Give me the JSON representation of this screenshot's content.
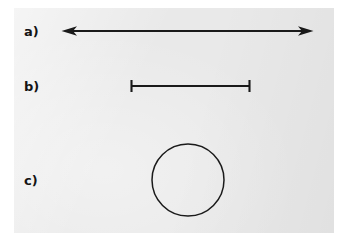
{
  "figure": {
    "panel": {
      "background_color": "#e9e9e9",
      "page_color": "#ffffff",
      "ink_color": "#1a1a1a",
      "x": 14,
      "y": 8,
      "width": 320,
      "height": 225
    },
    "rows": [
      {
        "label": "a)",
        "glyph": "double-headed-arrow",
        "description": "horizontal line with arrowheads at both ends",
        "x1": 62,
        "x2": 313,
        "y": 31,
        "stroke_width": 1.8,
        "arrowhead_length": 14,
        "arrowhead_halfwidth": 4.5
      },
      {
        "label": "b)",
        "glyph": "i-beam-segment",
        "description": "horizontal line segment with vertical end caps",
        "x1": 131,
        "x2": 250,
        "y": 86,
        "stroke_width": 1.8,
        "cap_halfheight": 6
      },
      {
        "label": "c)",
        "glyph": "circle-outline",
        "description": "open circle outline",
        "cx": 188,
        "cy": 180,
        "r": 36,
        "stroke_width": 1.4
      }
    ]
  }
}
